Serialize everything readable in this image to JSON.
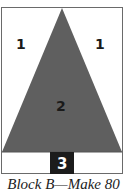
{
  "diagram": {
    "pieces": [
      {
        "id": "left-background",
        "label": "1",
        "color": "#ffffff"
      },
      {
        "id": "right-background",
        "label": "1",
        "color": "#ffffff"
      },
      {
        "id": "tree-triangle",
        "label": "2",
        "color": "#5f5f5f"
      },
      {
        "id": "trunk",
        "label": "3",
        "color": "#1c1c1c"
      }
    ],
    "caption": "Block B—Make 80"
  }
}
